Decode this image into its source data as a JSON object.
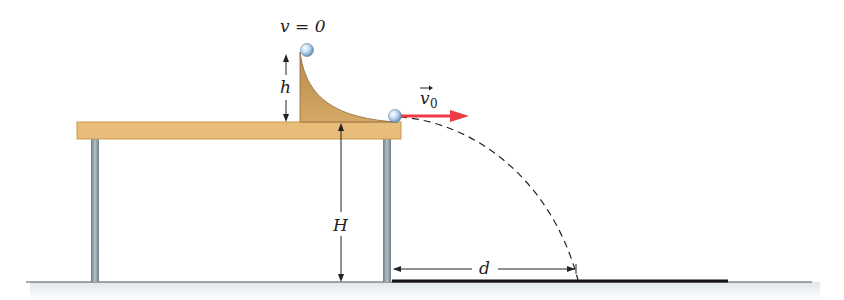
{
  "labels": {
    "v_top": "v = 0",
    "h": "h",
    "v0": "v",
    "v0_sub": "0",
    "H": "H",
    "d": "d"
  },
  "colors": {
    "table_wood": "#e8bd7a",
    "table_edge": "#c99a55",
    "ramp": "#c9995a",
    "ramp_edge": "#8a6a3a",
    "legs": "#8d9aa3",
    "ball": "#b8d6ef",
    "arrow": "#ee3a45",
    "ground": "#edf1f4",
    "trajectory": "#222222"
  }
}
